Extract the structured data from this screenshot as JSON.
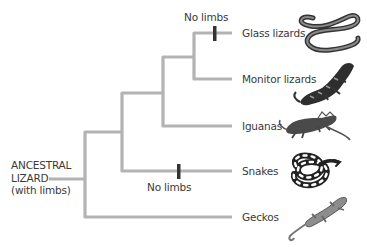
{
  "diagram": {
    "type": "phylogenetic-tree",
    "root_label": {
      "line1": "ANCESTRAL",
      "line2": "LIZARD",
      "line3": "(with limbs)"
    },
    "taxa": [
      {
        "name": "Glass lizards",
        "icon": "glass-lizard-illustration"
      },
      {
        "name": "Monitor lizards",
        "icon": "monitor-lizard-illustration"
      },
      {
        "name": "Iguanas",
        "icon": "iguana-illustration"
      },
      {
        "name": "Snakes",
        "icon": "snake-illustration"
      },
      {
        "name": "Geckos",
        "icon": "gecko-illustration"
      }
    ],
    "trait_marks": [
      {
        "label": "No limbs",
        "branch": "Glass lizards"
      },
      {
        "label": "No limbs",
        "branch": "Snakes"
      }
    ],
    "colors": {
      "branch": "#b3b3b3",
      "trait_mark": "#333333",
      "text": "#3a3a3a"
    }
  }
}
